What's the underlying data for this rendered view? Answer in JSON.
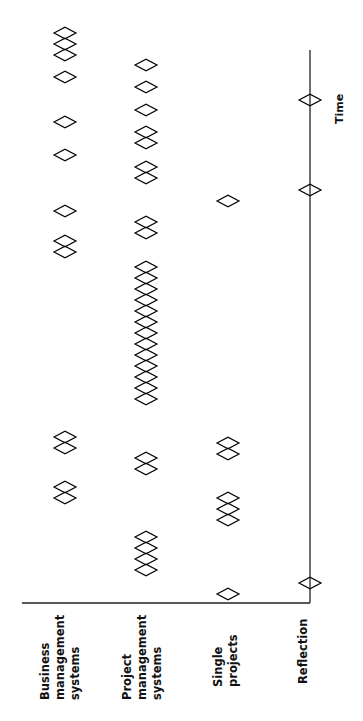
{
  "diagram": {
    "title": "",
    "orientation": "rotated-90-ccw",
    "axis_label": "Time",
    "stroke_color": "#000000",
    "background": "#ffffff",
    "rows": [
      {
        "id": "business",
        "label": "Business\nmanagement\nsystems",
        "x": 65,
        "events_y": [
          33,
          44,
          55,
          77,
          122,
          155,
          211,
          241,
          252,
          437,
          448,
          487,
          498
        ]
      },
      {
        "id": "project",
        "label": "Project\nmanagement\nsystems",
        "x": 146,
        "events_y": [
          65,
          87,
          110,
          132,
          143,
          167,
          178,
          222,
          233,
          267,
          278,
          289,
          300,
          311,
          322,
          333,
          344,
          355,
          366,
          377,
          388,
          399,
          458,
          469,
          537,
          548,
          559,
          570
        ]
      },
      {
        "id": "single",
        "label": "Single\nprojects",
        "x": 228,
        "events_y": [
          201,
          443,
          454,
          498,
          509,
          520,
          594
        ]
      },
      {
        "id": "reflection",
        "label": "Reflection",
        "x": 310,
        "events_y": [
          100,
          190,
          583
        ]
      }
    ],
    "time_axis": {
      "x": 310,
      "y_start": 50,
      "y_end": 603
    },
    "baseline": {
      "y": 603,
      "x_start": 22,
      "x_end": 310
    }
  },
  "labels": {
    "business": "Business\nmanagement\nsystems",
    "project": "Project\nmanagement\nsystems",
    "single": "Single\nprojects",
    "reflection": "Reflection",
    "time": "Time"
  }
}
